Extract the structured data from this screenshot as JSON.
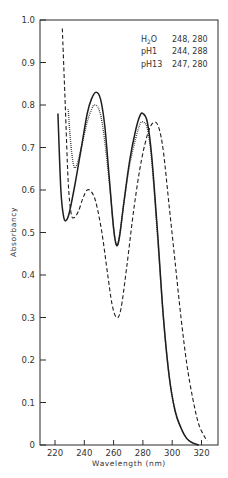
{
  "chart_data": {
    "type": "line",
    "title": "",
    "xlabel": "Wavelength (nm)",
    "ylabel": "Absorbancy",
    "xlim": [
      210,
      331
    ],
    "ylim": [
      0,
      1.0
    ],
    "grid": false,
    "legend_position": "upper-right",
    "x_ticks": [
      220,
      240,
      260,
      280,
      300,
      320
    ],
    "x_tick_labels": [
      "220",
      "240",
      "260",
      "280",
      "300",
      "320"
    ],
    "y_ticks": [
      0,
      0.1,
      0.2,
      0.3,
      0.4,
      0.5,
      0.6,
      0.7,
      0.8,
      0.9,
      1.0
    ],
    "y_tick_labels": [
      "0",
      "0.1",
      "0.2",
      "0.3",
      "0.4",
      "0.5",
      "0.6",
      "0.7",
      "0.8",
      "0.9",
      "1.0"
    ],
    "legend": [
      {
        "label": "H₂O",
        "maxima": "248, 280",
        "style": "solid"
      },
      {
        "label": "pH1",
        "maxima": "244, 288",
        "style": "dashed"
      },
      {
        "label": "pH13",
        "maxima": "247, 280",
        "style": "dotted"
      }
    ],
    "series": [
      {
        "name": "H₂O",
        "style": "solid",
        "points": [
          [
            222,
            0.78
          ],
          [
            224,
            0.6
          ],
          [
            226,
            0.535
          ],
          [
            228,
            0.53
          ],
          [
            230,
            0.55
          ],
          [
            234,
            0.62
          ],
          [
            238,
            0.7
          ],
          [
            242,
            0.78
          ],
          [
            245,
            0.815
          ],
          [
            248,
            0.83
          ],
          [
            251,
            0.815
          ],
          [
            254,
            0.75
          ],
          [
            257,
            0.63
          ],
          [
            260,
            0.51
          ],
          [
            262,
            0.47
          ],
          [
            264,
            0.49
          ],
          [
            267,
            0.57
          ],
          [
            271,
            0.67
          ],
          [
            275,
            0.74
          ],
          [
            278,
            0.775
          ],
          [
            280,
            0.78
          ],
          [
            283,
            0.76
          ],
          [
            286,
            0.68
          ],
          [
            290,
            0.5
          ],
          [
            294,
            0.3
          ],
          [
            298,
            0.16
          ],
          [
            302,
            0.08
          ],
          [
            306,
            0.04
          ],
          [
            310,
            0.015
          ],
          [
            314,
            0.005
          ],
          [
            318,
            0.0
          ]
        ]
      },
      {
        "name": "pH1",
        "style": "dashed",
        "points": [
          [
            225,
            0.98
          ],
          [
            227,
            0.8
          ],
          [
            229,
            0.62
          ],
          [
            231,
            0.545
          ],
          [
            233,
            0.535
          ],
          [
            236,
            0.55
          ],
          [
            239,
            0.58
          ],
          [
            242,
            0.6
          ],
          [
            245,
            0.595
          ],
          [
            248,
            0.57
          ],
          [
            252,
            0.5
          ],
          [
            256,
            0.4
          ],
          [
            259,
            0.33
          ],
          [
            262,
            0.3
          ],
          [
            265,
            0.32
          ],
          [
            269,
            0.42
          ],
          [
            274,
            0.56
          ],
          [
            279,
            0.67
          ],
          [
            284,
            0.74
          ],
          [
            288,
            0.76
          ],
          [
            291,
            0.745
          ],
          [
            294,
            0.69
          ],
          [
            298,
            0.56
          ],
          [
            302,
            0.43
          ],
          [
            306,
            0.3
          ],
          [
            310,
            0.19
          ],
          [
            314,
            0.11
          ],
          [
            318,
            0.05
          ],
          [
            322,
            0.02
          ],
          [
            324,
            0.01
          ]
        ]
      },
      {
        "name": "pH13",
        "style": "dotted",
        "points": [
          [
            229,
            0.79
          ],
          [
            231,
            0.7
          ],
          [
            233,
            0.655
          ],
          [
            235,
            0.66
          ],
          [
            238,
            0.7
          ],
          [
            242,
            0.76
          ],
          [
            245,
            0.79
          ],
          [
            247,
            0.8
          ],
          [
            250,
            0.79
          ],
          [
            253,
            0.74
          ],
          [
            257,
            0.62
          ],
          [
            260,
            0.51
          ],
          [
            262,
            0.47
          ],
          [
            264,
            0.49
          ],
          [
            267,
            0.57
          ],
          [
            271,
            0.66
          ],
          [
            275,
            0.72
          ],
          [
            278,
            0.755
          ],
          [
            280,
            0.76
          ],
          [
            283,
            0.745
          ],
          [
            286,
            0.67
          ],
          [
            290,
            0.49
          ],
          [
            294,
            0.3
          ],
          [
            298,
            0.16
          ],
          [
            302,
            0.08
          ],
          [
            306,
            0.04
          ],
          [
            310,
            0.015
          ],
          [
            314,
            0.005
          ],
          [
            318,
            0.0
          ]
        ]
      }
    ]
  }
}
